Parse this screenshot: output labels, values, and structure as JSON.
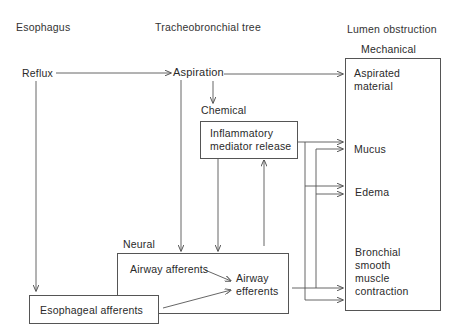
{
  "headers": {
    "esophagus": "Esophagus",
    "tracheobronchial": "Tracheobronchial tree",
    "lumen": "Lumen obstruction"
  },
  "nodes": {
    "reflux": "Reflux",
    "aspiration": "Aspiration",
    "chemical_label": "Chemical",
    "inflammatory_line1": "Inflammatory",
    "inflammatory_line2": "mediator release",
    "neural_label": "Neural",
    "airway_afferents": "Airway afferents",
    "airway_efferents_line1": "Airway",
    "airway_efferents_line2": "efferents",
    "esophageal_afferents": "Esophageal afferents",
    "mechanical_label": "Mechanical",
    "aspirated_line1": "Aspirated",
    "aspirated_line2": "material",
    "mucus": "Mucus",
    "edema": "Edema",
    "bronchial_line1": "Bronchial",
    "bronchial_line2": "smooth",
    "bronchial_line3": "muscle",
    "bronchial_line4": "contraction"
  },
  "edges": [
    {
      "from": "Reflux",
      "to": "Aspiration"
    },
    {
      "from": "Reflux",
      "to": "Esophageal afferents"
    },
    {
      "from": "Aspiration",
      "to": "Aspirated material"
    },
    {
      "from": "Aspiration",
      "to": "Chemical"
    },
    {
      "from": "Aspiration",
      "to": "Neural"
    },
    {
      "from": "Inflammatory mediator release",
      "to": "Neural"
    },
    {
      "from": "Neural",
      "to": "Inflammatory mediator release"
    },
    {
      "from": "Inflammatory mediator release",
      "to": "Mucus"
    },
    {
      "from": "Inflammatory mediator release",
      "to": "Edema"
    },
    {
      "from": "Inflammatory mediator release",
      "to": "Bronchial smooth muscle contraction"
    },
    {
      "from": "Airway efferents",
      "to": "Mucus"
    },
    {
      "from": "Airway efferents",
      "to": "Edema"
    },
    {
      "from": "Airway efferents",
      "to": "Bronchial smooth muscle contraction"
    },
    {
      "from": "Airway afferents",
      "to": "Airway efferents"
    },
    {
      "from": "Esophageal afferents",
      "to": "Airway efferents"
    }
  ],
  "colors": {
    "line": "#555555",
    "text": "#2a2a2a"
  }
}
